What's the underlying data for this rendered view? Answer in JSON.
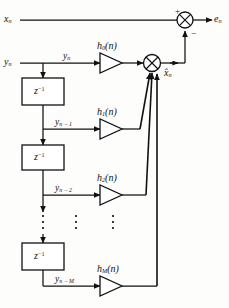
{
  "figure": {
    "type": "block-diagram",
    "background": "#fdfdfb",
    "line_color": "#111111",
    "box_fill": "#ffffff"
  },
  "signals": {
    "input_x": "x",
    "input_x_sub": "n",
    "input_y": "y",
    "input_y_sub": "n",
    "tap0": "y",
    "tap0_sub": "n",
    "tap1": "y",
    "tap1_sub": "n − 1",
    "tap2": "y",
    "tap2_sub": "n − 2",
    "tapM": "y",
    "tapM_sub": "n − M",
    "estimate": "x̂",
    "estimate_sub": "n",
    "error": "e",
    "error_sub": "n"
  },
  "delays": [
    {
      "name": "delay-1",
      "label": "z",
      "exponent": "−1"
    },
    {
      "name": "delay-2",
      "label": "z",
      "exponent": "−1"
    },
    {
      "name": "delay-3",
      "label": "z",
      "exponent": "−1"
    }
  ],
  "gains": [
    {
      "name": "gain-h0",
      "label": "h",
      "sub": "0",
      "arg": "(n)"
    },
    {
      "name": "gain-h1",
      "label": "h",
      "sub": "1",
      "arg": "(n)"
    },
    {
      "name": "gain-h2",
      "label": "h",
      "sub": "2",
      "arg": "(n)"
    },
    {
      "name": "gain-hM",
      "label": "h",
      "sub": "M",
      "arg": "(n)"
    }
  ],
  "adders": [
    {
      "name": "error-adder",
      "plus": "+",
      "minus": "−"
    },
    {
      "name": "output-summer",
      "plus": "",
      "minus": ""
    }
  ],
  "ellipsis": {
    "count": 3,
    "dots_per_group": 3
  }
}
